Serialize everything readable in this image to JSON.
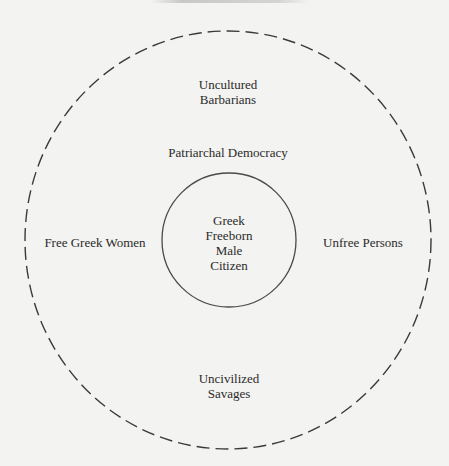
{
  "diagram": {
    "type": "concentric-circles",
    "outer_circle": {
      "style": "dashed",
      "cx": 228,
      "cy": 240,
      "rx": 203,
      "ry": 209,
      "stroke": "#3a3a3a"
    },
    "inner_circle": {
      "style": "solid",
      "cx": 229,
      "cy": 240,
      "r": 67,
      "stroke": "#4a4a4a"
    },
    "center_label": {
      "lines": [
        "Greek",
        "Freeborn",
        "Male",
        "Citizen"
      ]
    },
    "ring_labels": {
      "top": {
        "lines": [
          "Uncultured",
          "Barbarians"
        ]
      },
      "upper": {
        "text": "Patriarchal Democracy"
      },
      "left": {
        "text": "Free Greek Women"
      },
      "right": {
        "text": "Unfree Persons"
      },
      "bottom": {
        "lines": [
          "Uncivilized",
          "Savages"
        ]
      }
    },
    "colors": {
      "background": "#f3f3f1",
      "text": "#2a2a2a",
      "line": "#3a3a3a"
    }
  }
}
